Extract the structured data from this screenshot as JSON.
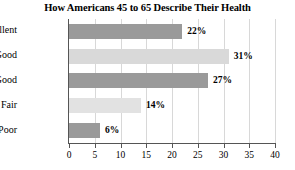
{
  "chart_data": {
    "type": "bar",
    "orientation": "horizontal",
    "title": "How Americans 45 to 65 Describe Their Health",
    "categories": [
      "Excellent",
      "Very Good",
      "Good",
      "Fair",
      "Poor"
    ],
    "values": [
      22,
      31,
      27,
      14,
      6
    ],
    "value_labels": [
      "22%",
      "31%",
      "27%",
      "14%",
      "6%"
    ],
    "bar_colors": [
      "#9a9a9a",
      "#d9d9d9",
      "#9a9a9a",
      "#e2e2e2",
      "#9a9a9a"
    ],
    "xlabel": "",
    "ylabel": "",
    "xlim": [
      0,
      40
    ],
    "xticks": [
      0,
      5,
      10,
      15,
      20,
      25,
      30,
      35,
      40
    ],
    "xtick_labels": [
      "0",
      "5",
      "10",
      "15",
      "20",
      "25",
      "30",
      "35",
      "40"
    ],
    "grid": true,
    "grid_axis": "x",
    "legend": false,
    "legend_position": "none",
    "axis_color": "#555555",
    "grid_color": "#d8d8d8",
    "background_color": "#ffffff",
    "text_color": "#000000"
  }
}
